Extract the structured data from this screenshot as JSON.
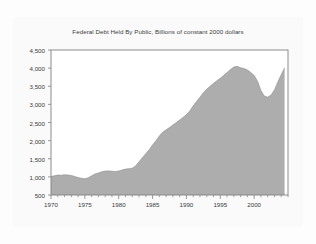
{
  "chart_data": {
    "type": "area",
    "title": "Federal Debt Held By Public, Billions of constant 2000 dollars",
    "xlabel": "",
    "ylabel": "",
    "xlim": [
      1970,
      2005
    ],
    "ylim": [
      500,
      4500
    ],
    "grid": false,
    "legend": "none",
    "series_name": "Federal Debt Held By Public",
    "fill_color": "#adadad",
    "line_color": "#8a8a8a",
    "yticks": [
      500,
      1000,
      1500,
      2000,
      2500,
      3000,
      3500,
      4000,
      4500
    ],
    "ytick_labels": [
      "500",
      "1,000",
      "1,500",
      "2,000",
      "2,500",
      "3,000",
      "3,500",
      "4,000",
      "4,500"
    ],
    "xticks": [
      1970,
      1975,
      1980,
      1985,
      1990,
      1995,
      2000
    ],
    "xtick_labels": [
      "1970",
      "1975",
      "1980",
      "1985",
      "1990",
      "1995",
      "2000"
    ],
    "x": [
      1970.0,
      1970.5,
      1971.0,
      1971.5,
      1972.0,
      1972.5,
      1973.0,
      1973.5,
      1974.0,
      1974.5,
      1975.0,
      1975.5,
      1976.0,
      1976.5,
      1977.0,
      1977.5,
      1978.0,
      1978.5,
      1979.0,
      1979.5,
      1980.0,
      1980.5,
      1981.0,
      1981.5,
      1982.0,
      1982.5,
      1983.0,
      1983.5,
      1984.0,
      1984.5,
      1985.0,
      1985.5,
      1986.0,
      1986.5,
      1987.0,
      1987.5,
      1988.0,
      1988.5,
      1989.0,
      1989.5,
      1990.0,
      1990.5,
      1991.0,
      1991.5,
      1992.0,
      1992.5,
      1993.0,
      1993.5,
      1994.0,
      1994.5,
      1995.0,
      1995.5,
      1996.0,
      1996.5,
      1997.0,
      1997.5,
      1998.0,
      1998.5,
      1999.0,
      1999.5,
      2000.0,
      2000.5,
      2001.0,
      2001.5,
      2002.0,
      2002.5,
      2003.0,
      2003.5,
      2004.0,
      2004.5
    ],
    "values": [
      1010,
      1030,
      1050,
      1045,
      1060,
      1050,
      1040,
      1010,
      980,
      960,
      945,
      975,
      1030,
      1080,
      1110,
      1140,
      1160,
      1165,
      1155,
      1150,
      1160,
      1190,
      1215,
      1225,
      1240,
      1300,
      1420,
      1530,
      1640,
      1750,
      1880,
      2000,
      2130,
      2230,
      2300,
      2360,
      2430,
      2500,
      2570,
      2640,
      2720,
      2820,
      2960,
      3080,
      3200,
      3320,
      3420,
      3500,
      3580,
      3650,
      3720,
      3800,
      3880,
      3960,
      4030,
      4050,
      4010,
      3990,
      3950,
      3880,
      3800,
      3640,
      3380,
      3230,
      3200,
      3260,
      3400,
      3620,
      3820,
      4010
    ],
    "annotations": []
  }
}
